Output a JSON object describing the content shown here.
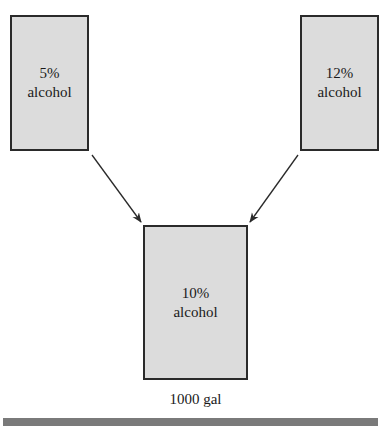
{
  "tanks": {
    "left": {
      "percent": "5%",
      "label": "alcohol"
    },
    "right": {
      "percent": "12%",
      "label": "alcohol"
    },
    "mix": {
      "percent": "10%",
      "label": "alcohol",
      "volume": "1000 gal"
    }
  },
  "colors": {
    "tank_fill": "#dcdcdc",
    "border": "#2a2a2a",
    "bar": "#7a7a7a"
  }
}
